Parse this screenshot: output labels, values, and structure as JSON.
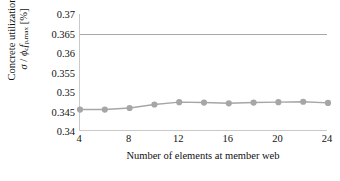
{
  "chart_data": {
    "type": "line",
    "title": "",
    "xlabel": "Number of elements at member web",
    "ylabel_line1": "Concrete utilization",
    "ylabel_line2": "σ / φc fp,max [%]",
    "x": [
      4,
      6,
      8,
      10,
      12,
      14,
      16,
      18,
      20,
      22,
      24
    ],
    "values": [
      0.3455,
      0.3455,
      0.3459,
      0.3468,
      0.3474,
      0.3473,
      0.3471,
      0.3473,
      0.3474,
      0.3475,
      0.3472
    ],
    "series": [
      {
        "name": "Concrete utilization",
        "values": [
          0.3455,
          0.3455,
          0.3459,
          0.3468,
          0.3474,
          0.3473,
          0.3471,
          0.3473,
          0.3474,
          0.3475,
          0.3472
        ],
        "color": "#a6a6a6",
        "marker": "circle"
      }
    ],
    "reference_lines": [
      {
        "name": "limit",
        "value": 0.365,
        "color": "#a8a8a8"
      }
    ],
    "xlim": [
      4,
      24
    ],
    "ylim": [
      0.34,
      0.37
    ],
    "xticks": [
      4,
      8,
      12,
      16,
      20,
      24
    ],
    "xticklabels": [
      "4",
      "8",
      "12",
      "16",
      "20",
      "24"
    ],
    "yticks": [
      0.34,
      0.345,
      0.35,
      0.355,
      0.36,
      0.365,
      0.37
    ],
    "yticklabels": [
      "0.34",
      "0.345",
      "0.35",
      "0.355",
      "0.36",
      "0.365",
      "0.37"
    ],
    "grid": false,
    "legend": "none",
    "axis_color": "#c9c9c9",
    "text_color": "#111111"
  }
}
